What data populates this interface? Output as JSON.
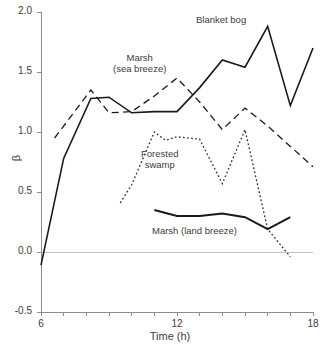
{
  "chart_data": {
    "type": "line",
    "title": "",
    "xlabel": "Time (h)",
    "ylabel": "β",
    "xlim": [
      6,
      18
    ],
    "ylim": [
      -0.5,
      2.0
    ],
    "xticks": [
      6,
      7,
      8,
      9,
      10,
      11,
      12,
      13,
      14,
      15,
      16,
      17,
      18
    ],
    "xtick_labels": [
      "6",
      "",
      "",
      "",
      "",
      "",
      "12",
      "",
      "",
      "",
      "",
      "",
      "18"
    ],
    "yticks": [
      -0.5,
      0.0,
      0.5,
      1.0,
      1.5,
      2.0
    ],
    "ytick_labels": [
      "-0.5",
      "0.0",
      "0.5",
      "1.0",
      "1.5",
      "2.0"
    ],
    "grid": false,
    "legend": "inline-annotations",
    "zero_line": true,
    "series": [
      {
        "name": "Blanket bog",
        "style": "solid",
        "color": "#1a1a1a",
        "width": 1.6,
        "x": [
          6,
          7,
          8.2,
          9,
          10,
          11,
          12,
          13,
          14,
          15,
          16,
          17,
          18
        ],
        "y": [
          -0.11,
          0.78,
          1.28,
          1.29,
          1.16,
          1.17,
          1.17,
          1.37,
          1.6,
          1.54,
          1.88,
          1.22,
          1.7
        ]
      },
      {
        "name": "Marsh (sea breeze)",
        "style": "dashed",
        "color": "#1a1a1a",
        "width": 1.3,
        "x": [
          6.6,
          8.2,
          9,
          10,
          11,
          12,
          13,
          14,
          15,
          16,
          17,
          18
        ],
        "y": [
          0.95,
          1.35,
          1.16,
          1.17,
          1.3,
          1.45,
          1.25,
          1.02,
          1.2,
          1.05,
          0.88,
          0.71
        ]
      },
      {
        "name": "Forested swamp",
        "style": "dotted",
        "color": "#2b2b2b",
        "width": 1.3,
        "x": [
          9.5,
          10,
          11,
          11.5,
          12,
          13,
          14,
          15,
          16,
          17
        ],
        "y": [
          0.41,
          0.56,
          1.0,
          0.93,
          0.96,
          0.94,
          0.57,
          1.02,
          0.19,
          -0.04
        ]
      },
      {
        "name": "Marsh (land breeze)",
        "style": "solid",
        "color": "#1a1a1a",
        "width": 2.0,
        "x": [
          11,
          12,
          13,
          14,
          15,
          16,
          17
        ],
        "y": [
          0.35,
          0.3,
          0.3,
          0.32,
          0.29,
          0.19,
          0.29
        ]
      }
    ],
    "annotations": [
      {
        "id": "blanket-bog",
        "text": "Blanket bog"
      },
      {
        "id": "marsh-sea",
        "text": "Marsh\n(sea breeze)"
      },
      {
        "id": "forested-swamp",
        "text": "Forested\nswamp"
      },
      {
        "id": "marsh-land",
        "text": "Marsh (land breeze)"
      }
    ],
    "colors": {
      "axis": "#8c8c8c",
      "text": "#3c3c3b",
      "line": "#1a1a1a",
      "background": "#ffffff"
    }
  }
}
